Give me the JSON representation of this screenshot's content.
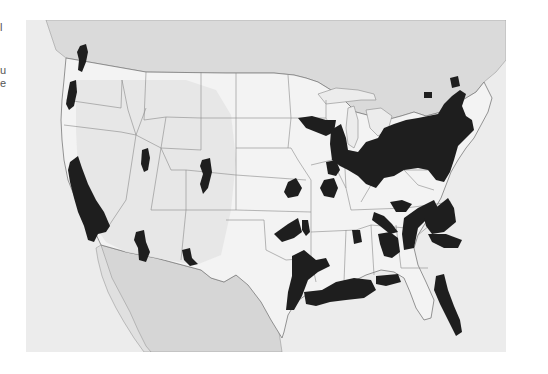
{
  "margin_text": {
    "fragments": [
      {
        "text": "l",
        "top": 22
      },
      {
        "text": "u",
        "top": 65
      },
      {
        "text": "e",
        "top": 78
      }
    ]
  },
  "map": {
    "subject": "Continental United States with shaded regions",
    "colors": {
      "ocean": "#ececec",
      "foreign_land": "#d9d9d9",
      "us_land": "#f4f4f4",
      "mountain_shade": "#e2e2e2",
      "borders": "#8a8a8a",
      "shaded_regions": "#1e1e1e"
    },
    "shaded_region_labels": [
      "Puget Sound, WA",
      "Willamette Valley, OR",
      "Central California",
      "Salt Lake area, UT",
      "Front Range, CO",
      "Central Arizona",
      "El Paso area",
      "Minneapolis area, MN",
      "Kansas City area",
      "Great Lakes / Northeast corridor",
      "St. Louis area",
      "Oklahoma",
      "Central Texas",
      "Gulf Coast TX-LA",
      "Tennessee / Kentucky",
      "Appalachian piedmont",
      "Atlanta / Alabama",
      "Florida peninsula",
      "Montreal area",
      "Ottawa area"
    ]
  }
}
